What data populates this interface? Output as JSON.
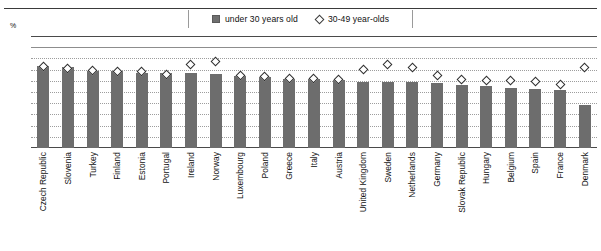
{
  "axis": {
    "unit_label": "%",
    "ticks": [
      100,
      90,
      80,
      70,
      60,
      50,
      40,
      30,
      20,
      10,
      0
    ]
  },
  "legend": {
    "items": [
      {
        "label": "under 30 years old",
        "marker": "filled-square",
        "color": "#6d6d6d"
      },
      {
        "label": "30-49 year-olds",
        "marker": "open-diamond",
        "color": "#ffffff"
      }
    ]
  },
  "chart_data": {
    "type": "bar",
    "title": "",
    "xlabel": "",
    "ylabel": "%",
    "ylim": [
      0,
      100
    ],
    "ytick_step": 10,
    "grid": true,
    "legend_position": "top-center",
    "categories": [
      "Czech Republic",
      "Slovenia",
      "Turkey",
      "Finland",
      "Estonia",
      "Portugal",
      "Ireland",
      "Norway",
      "Luxembourg",
      "Poland",
      "Greece",
      "Italy",
      "Austria",
      "United Kingdom",
      "Sweden",
      "Netherlands",
      "Germany",
      "Slovak Republic",
      "Hungary",
      "Belgium",
      "Spain",
      "France",
      "Denmark"
    ],
    "series": [
      {
        "name": "under 30 years old",
        "marker": "bar",
        "color": "#6d6d6d",
        "values": [
          73,
          72,
          69,
          69,
          67,
          67,
          67,
          66,
          64,
          63,
          62,
          62,
          61,
          59,
          59,
          59,
          58,
          56,
          55,
          54,
          53,
          52,
          38
        ]
      },
      {
        "name": "30-49 year-olds",
        "marker": "open-diamond",
        "color": "#ffffff",
        "values": [
          73,
          71,
          69,
          68,
          68,
          66,
          75,
          77,
          65,
          64,
          62,
          62,
          61,
          70,
          75,
          72,
          65,
          61,
          60,
          60,
          59,
          57,
          72
        ]
      }
    ]
  }
}
